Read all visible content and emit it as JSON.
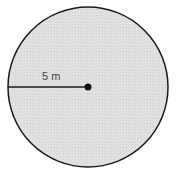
{
  "diagram": {
    "shape": "circle",
    "radius_label": "5 m",
    "fill_color": "#dcdcdc",
    "stroke_color": "#1a1a1a",
    "center_point_color": "#111111"
  }
}
